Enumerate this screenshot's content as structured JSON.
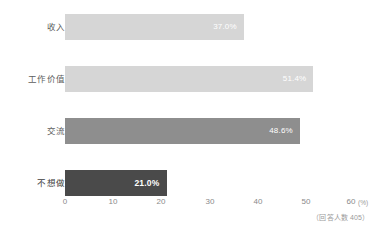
{
  "chart_data": {
    "type": "bar",
    "orientation": "horizontal",
    "title": "",
    "xlabel": "",
    "ylabel": "",
    "categories": [
      "收入",
      "工作价值",
      "交流",
      "不想做"
    ],
    "values": [
      37.0,
      51.4,
      48.6,
      21.0
    ],
    "value_labels": [
      "37.0%",
      "51.4%",
      "48.6%",
      "21.0%"
    ],
    "bar_colors": [
      "#d6d6d6",
      "#d6d6d6",
      "#8e8e8e",
      "#4a4a4a"
    ],
    "xlim": [
      0,
      60
    ],
    "xticks": [
      0,
      10,
      20,
      30,
      40,
      50,
      60
    ],
    "xtick_labels": [
      "0",
      "10",
      "20",
      "30",
      "40",
      "50",
      "60"
    ],
    "unit": "(%)",
    "grid": false,
    "legend": false,
    "annotation": "（回答人数 405）"
  },
  "axis": {
    "unit_label": "(%)"
  },
  "footnote": {
    "text": "（回答人数 405）"
  }
}
